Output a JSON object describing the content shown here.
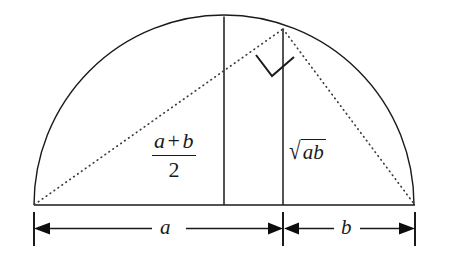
{
  "figure": {
    "background_color": "#ffffff",
    "stroke_color": "#1a1a1a",
    "dotted_color": "#3c3c3c",
    "geometry": {
      "left_endpoint_x": 34,
      "right_endpoint_x": 415,
      "baseline_y": 205,
      "center_x": 224,
      "radius": 190,
      "apex_y": 16,
      "split_x": 283,
      "chord_top_y": 29,
      "dimension_line_y": 228,
      "tick_top_y": 212,
      "tick_bottom_y": 245
    },
    "labels": {
      "mean_numerator_a": "a",
      "mean_numerator_op": "+",
      "mean_numerator_b": "b",
      "mean_denominator": "2",
      "sqrt_symbol": "√",
      "sqrt_radicand": "ab",
      "segment_a": "a",
      "segment_b": "b"
    },
    "elements": {
      "semicircle_arc": "semicircle-arc",
      "diameter_baseline": "diameter-baseline",
      "radius_vertical": "vertical-radius-line",
      "altitude_chord": "vertical-altitude-chord",
      "chord_left": "dotted-chord-left",
      "chord_right": "dotted-chord-right",
      "right_angle_mark": "right-angle-marker",
      "dimension_a": "dimension-line-a",
      "dimension_b": "dimension-line-b"
    }
  }
}
